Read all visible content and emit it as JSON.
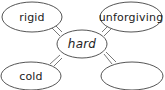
{
  "diagram": {
    "type": "word-web",
    "center": {
      "label": "hard",
      "cx": 82,
      "cy": 44,
      "rx": 25,
      "ry": 14
    },
    "nodes": [
      {
        "id": "top-left",
        "label": "rigid",
        "cx": 32,
        "cy": 17,
        "rx": 30,
        "ry": 15
      },
      {
        "id": "top-right",
        "label": "unforgiving",
        "cx": 131,
        "cy": 17,
        "rx": 31,
        "ry": 15
      },
      {
        "id": "bottom-left",
        "label": "cold",
        "cx": 31,
        "cy": 76,
        "rx": 30,
        "ry": 15
      },
      {
        "id": "bottom-right",
        "label": "",
        "cx": 132,
        "cy": 76,
        "rx": 31,
        "ry": 15
      }
    ],
    "colors": {
      "stroke": "#555555",
      "text": "#222222",
      "background": "#ffffff"
    }
  }
}
